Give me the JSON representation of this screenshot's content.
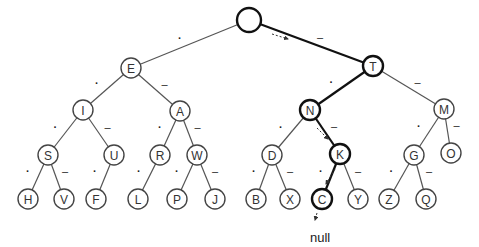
{
  "diagram": {
    "type": "morse-code-binary-tree",
    "left_edge_symbol": ".",
    "right_edge_symbol": "-",
    "null_label": "null",
    "nodes": [
      {
        "id": "root",
        "label": "",
        "x": 249,
        "y": 20,
        "r": 12,
        "bold": true
      },
      {
        "id": "E",
        "label": "E",
        "x": 131,
        "y": 68,
        "r": 10
      },
      {
        "id": "T",
        "label": "T",
        "x": 373,
        "y": 66,
        "r": 10,
        "bold": true
      },
      {
        "id": "I",
        "label": "I",
        "x": 83,
        "y": 110,
        "r": 10
      },
      {
        "id": "A",
        "label": "A",
        "x": 180,
        "y": 111,
        "r": 10
      },
      {
        "id": "N",
        "label": "N",
        "x": 310,
        "y": 110,
        "r": 10,
        "bold": true
      },
      {
        "id": "M",
        "label": "M",
        "x": 444,
        "y": 109,
        "r": 10
      },
      {
        "id": "S",
        "label": "S",
        "x": 48,
        "y": 155,
        "r": 10
      },
      {
        "id": "U",
        "label": "U",
        "x": 114,
        "y": 155,
        "r": 10
      },
      {
        "id": "R",
        "label": "R",
        "x": 160,
        "y": 155,
        "r": 10
      },
      {
        "id": "W",
        "label": "W",
        "x": 197,
        "y": 155,
        "r": 10
      },
      {
        "id": "D",
        "label": "D",
        "x": 272,
        "y": 155,
        "r": 10
      },
      {
        "id": "K",
        "label": "K",
        "x": 340,
        "y": 154,
        "r": 10,
        "bold": true
      },
      {
        "id": "G",
        "label": "G",
        "x": 414,
        "y": 155,
        "r": 10
      },
      {
        "id": "O",
        "label": "O",
        "x": 451,
        "y": 153,
        "r": 10
      },
      {
        "id": "H",
        "label": "H",
        "x": 28,
        "y": 199,
        "r": 10
      },
      {
        "id": "V",
        "label": "V",
        "x": 64,
        "y": 199,
        "r": 10
      },
      {
        "id": "F",
        "label": "F",
        "x": 96,
        "y": 199,
        "r": 10
      },
      {
        "id": "L",
        "label": "L",
        "x": 138,
        "y": 199,
        "r": 10
      },
      {
        "id": "P",
        "label": "P",
        "x": 177,
        "y": 199,
        "r": 10
      },
      {
        "id": "J",
        "label": "J",
        "x": 215,
        "y": 199,
        "r": 10
      },
      {
        "id": "B",
        "label": "B",
        "x": 256,
        "y": 199,
        "r": 10
      },
      {
        "id": "X",
        "label": "X",
        "x": 290,
        "y": 199,
        "r": 10
      },
      {
        "id": "C",
        "label": "C",
        "x": 322,
        "y": 199,
        "r": 10,
        "bold": true
      },
      {
        "id": "Y",
        "label": "Y",
        "x": 358,
        "y": 199,
        "r": 10
      },
      {
        "id": "Z",
        "label": "Z",
        "x": 389,
        "y": 199,
        "r": 10
      },
      {
        "id": "Q",
        "label": "Q",
        "x": 426,
        "y": 199,
        "r": 10
      }
    ],
    "edges": [
      {
        "from": "root",
        "to": "E",
        "symbol": "."
      },
      {
        "from": "root",
        "to": "T",
        "symbol": "-",
        "bold": true
      },
      {
        "from": "E",
        "to": "I",
        "symbol": "."
      },
      {
        "from": "E",
        "to": "A",
        "symbol": "-"
      },
      {
        "from": "T",
        "to": "N",
        "symbol": ".",
        "bold": true
      },
      {
        "from": "T",
        "to": "M",
        "symbol": "-"
      },
      {
        "from": "I",
        "to": "S",
        "symbol": "."
      },
      {
        "from": "I",
        "to": "U",
        "symbol": "-"
      },
      {
        "from": "A",
        "to": "R",
        "symbol": "."
      },
      {
        "from": "A",
        "to": "W",
        "symbol": "-"
      },
      {
        "from": "N",
        "to": "D",
        "symbol": "."
      },
      {
        "from": "N",
        "to": "K",
        "symbol": "-",
        "bold": true
      },
      {
        "from": "M",
        "to": "G",
        "symbol": "."
      },
      {
        "from": "M",
        "to": "O",
        "symbol": "-"
      },
      {
        "from": "S",
        "to": "H",
        "symbol": "."
      },
      {
        "from": "S",
        "to": "V",
        "symbol": "-"
      },
      {
        "from": "U",
        "to": "F",
        "symbol": "."
      },
      {
        "from": "R",
        "to": "L",
        "symbol": "."
      },
      {
        "from": "W",
        "to": "P",
        "symbol": "."
      },
      {
        "from": "W",
        "to": "J",
        "symbol": "-"
      },
      {
        "from": "D",
        "to": "B",
        "symbol": "."
      },
      {
        "from": "D",
        "to": "X",
        "symbol": "-"
      },
      {
        "from": "K",
        "to": "C",
        "symbol": ".",
        "bold": true
      },
      {
        "from": "K",
        "to": "Y",
        "symbol": "-"
      },
      {
        "from": "G",
        "to": "Z",
        "symbol": "."
      },
      {
        "from": "G",
        "to": "Q",
        "symbol": "-"
      }
    ],
    "traversal_arrows": [
      {
        "x1": 272,
        "y1": 34,
        "x2": 288,
        "y2": 39
      },
      {
        "x1": 317,
        "y1": 128,
        "x2": 328,
        "y2": 139
      },
      {
        "x1": 335,
        "y1": 169,
        "x2": 326,
        "y2": 184
      },
      {
        "x1": 317,
        "y1": 213,
        "x2": 315,
        "y2": 220
      }
    ],
    "null_position": {
      "x": 310,
      "y": 242
    }
  }
}
